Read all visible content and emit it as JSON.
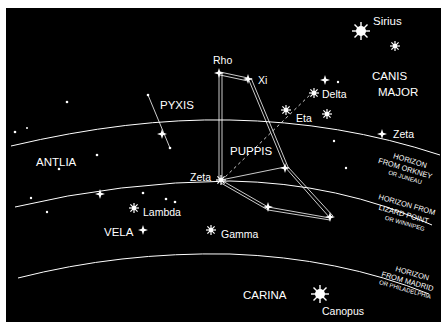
{
  "colors": {
    "background": "#000000",
    "foreground": "#ffffff",
    "border": "#ffffff"
  },
  "constellations": [
    {
      "name": "PYXIS",
      "x": 186,
      "y": 105
    },
    {
      "name": "ANTLIA",
      "x": 36,
      "y": 162
    },
    {
      "name": "PUPPIS",
      "x": 255,
      "y": 152
    },
    {
      "name": "VELA",
      "x": 104,
      "y": 233
    },
    {
      "name": "CANIS",
      "x": 370,
      "y": 79
    },
    {
      "name": "MAJOR",
      "x": 369,
      "y": 95
    },
    {
      "name": "CARINA",
      "x": 242,
      "y": 298
    }
  ],
  "stars": {
    "sirius": "Sirius",
    "rho": "Rho",
    "xi": "Xi",
    "delta": "Delta",
    "eta": "Eta",
    "zeta_cma": "Zeta",
    "zeta_pup": "Zeta",
    "lambda": "Lambda",
    "gamma": "Gamma",
    "canopus": "Canopus"
  },
  "horizons": [
    {
      "line1": "HORIZON",
      "line2": "FROM ORKNEY",
      "line3": "OR JUNEAU"
    },
    {
      "line1": "HORIZON FROM",
      "line2": "LIZARD POINT",
      "line3": "OR WINNIPEG"
    },
    {
      "line1": "HORIZON",
      "line2": "FROM MADRID",
      "line3": "OR PHILADELPHIA"
    }
  ]
}
